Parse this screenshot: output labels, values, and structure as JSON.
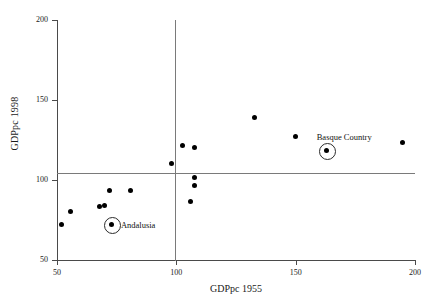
{
  "chart_data": {
    "type": "scatter",
    "title": "",
    "xlabel": "GDPpc 1955",
    "ylabel": "GDPpc 1998",
    "xlim": [
      50,
      200
    ],
    "ylim": [
      50,
      200
    ],
    "xticks": [
      50,
      100,
      150,
      200
    ],
    "yticks": [
      50,
      100,
      150,
      200
    ],
    "grid": false,
    "reference_lines": {
      "x": 100,
      "y": 100
    },
    "legend": "none",
    "points": [
      {
        "x": 52,
        "y": 72,
        "label": "",
        "highlight": false
      },
      {
        "x": 56,
        "y": 80,
        "label": "",
        "highlight": false
      },
      {
        "x": 68,
        "y": 83,
        "label": "",
        "highlight": false
      },
      {
        "x": 70,
        "y": 84,
        "label": "",
        "highlight": false
      },
      {
        "x": 72,
        "y": 93,
        "label": "",
        "highlight": false
      },
      {
        "x": 73,
        "y": 72,
        "label": "Andalusia",
        "highlight": true
      },
      {
        "x": 81,
        "y": 93,
        "label": "",
        "highlight": false
      },
      {
        "x": 98,
        "y": 110,
        "label": "",
        "highlight": false
      },
      {
        "x": 103,
        "y": 121,
        "label": "",
        "highlight": false
      },
      {
        "x": 106,
        "y": 86,
        "label": "",
        "highlight": false
      },
      {
        "x": 108,
        "y": 120,
        "label": "",
        "highlight": false
      },
      {
        "x": 108,
        "y": 101,
        "label": "",
        "highlight": false
      },
      {
        "x": 108,
        "y": 96,
        "label": "",
        "highlight": false
      },
      {
        "x": 133,
        "y": 139,
        "label": "",
        "highlight": false
      },
      {
        "x": 150,
        "y": 127,
        "label": "",
        "highlight": false
      },
      {
        "x": 163,
        "y": 118,
        "label": "Basque Country",
        "highlight": true
      },
      {
        "x": 195,
        "y": 123,
        "label": "",
        "highlight": false
      }
    ]
  },
  "labels": {
    "andalusia": "Andalusia",
    "basque": "Basque Country"
  }
}
